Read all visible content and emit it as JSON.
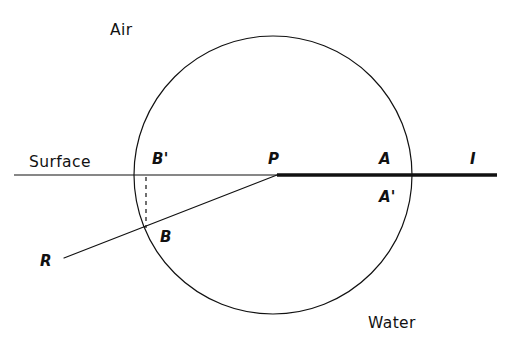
{
  "figure": {
    "background_color": "#ffffff",
    "stroke_color": "#111111",
    "width": 511,
    "height": 355
  },
  "labels": {
    "air": "Air",
    "water": "Water",
    "surface": "Surface",
    "point_p": "P",
    "point_a": "A",
    "point_a_prime": "A'",
    "point_b": "B",
    "point_b_prime": "B'",
    "ray_r": "R",
    "ray_i": "I"
  },
  "geometry": {
    "circle": {
      "cx": 273,
      "cy": 175,
      "r": 139,
      "stroke_width": 1.2
    },
    "surface_line": {
      "y": 175,
      "thin_segment": {
        "x1": 14,
        "x2": 277,
        "stroke_width": 1.2
      },
      "bold_segment": {
        "x1": 277,
        "x2": 497,
        "stroke_width": 3.6
      }
    },
    "incident_ray": {
      "x1": 64,
      "y1": 258,
      "x2": 277,
      "y2": 175,
      "stroke_width": 1.2
    },
    "dashed_perpendicular": {
      "x": 146,
      "y1": 177,
      "y2": 228,
      "stroke_width": 1.2,
      "dash": "4 4"
    }
  },
  "label_positions": {
    "air": {
      "left": 110,
      "top": 23
    },
    "water": {
      "left": 368,
      "top": 316
    },
    "surface": {
      "left": 29,
      "top": 155
    },
    "point_b_prime": {
      "left": 152,
      "top": 152
    },
    "point_p": {
      "left": 268,
      "top": 152
    },
    "point_a": {
      "left": 379,
      "top": 152
    },
    "point_a_prime": {
      "left": 379,
      "top": 190
    },
    "point_b": {
      "left": 160,
      "top": 230
    },
    "ray_r": {
      "left": 40,
      "top": 254
    },
    "ray_i": {
      "left": 470,
      "top": 152
    }
  }
}
